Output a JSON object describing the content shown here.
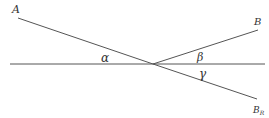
{
  "diagram": {
    "labels": {
      "point_a": "A",
      "point_b": "B",
      "point_br": "B",
      "point_br_sub": "R",
      "angle_alpha": "α",
      "angle_beta": "β",
      "angle_gamma": "γ"
    },
    "colors": {
      "line": "#444444",
      "text": "#333333"
    }
  }
}
